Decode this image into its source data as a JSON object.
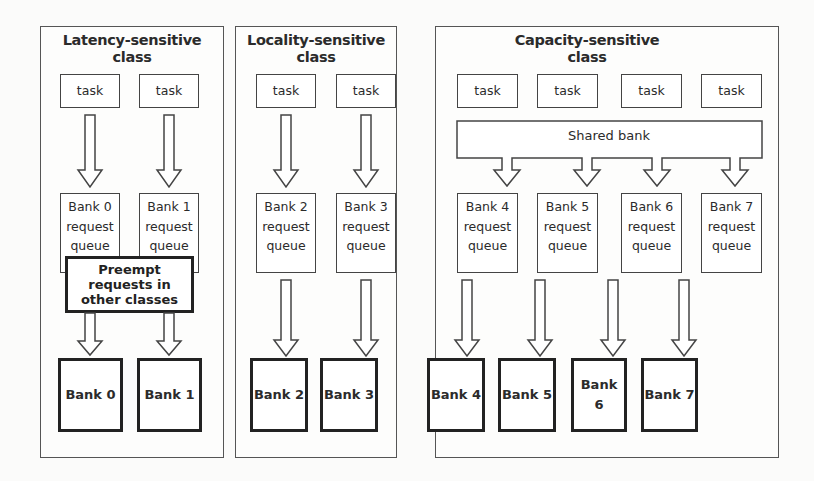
{
  "diagram": {
    "classes": [
      {
        "title_line1": "Latency-sensitive",
        "title_line2": "class",
        "tasks": [
          "task",
          "task"
        ],
        "queues": [
          {
            "bank": "Bank 0",
            "l2": "request",
            "l3": "queue"
          },
          {
            "bank": "Bank 1",
            "l2": "request",
            "l3": "queue"
          }
        ],
        "preempt": {
          "l1": "Preempt",
          "l2": "requests in",
          "l3": "other classes"
        },
        "banks": [
          "Bank 0",
          "Bank 1"
        ]
      },
      {
        "title_line1": "Locality-sensitive",
        "title_line2": "class",
        "tasks": [
          "task",
          "task"
        ],
        "queues": [
          {
            "bank": "Bank 2",
            "l2": "request",
            "l3": "queue"
          },
          {
            "bank": "Bank 3",
            "l2": "request",
            "l3": "queue"
          }
        ],
        "banks": [
          "Bank 2",
          "Bank 3"
        ]
      },
      {
        "title_line1": "Capacity-sensitive",
        "title_line2": "class",
        "tasks": [
          "task",
          "task",
          "task",
          "task"
        ],
        "shared": "Shared bank",
        "queues": [
          {
            "bank": "Bank 4",
            "l2": "request",
            "l3": "queue"
          },
          {
            "bank": "Bank 5",
            "l2": "request",
            "l3": "queue"
          },
          {
            "bank": "Bank 6",
            "l2": "request",
            "l3": "queue"
          },
          {
            "bank": "Bank 7",
            "l2": "request",
            "l3": "queue"
          }
        ],
        "banks": [
          "Bank 4",
          "Bank 5",
          "Bank 6",
          "Bank 7"
        ]
      }
    ]
  }
}
